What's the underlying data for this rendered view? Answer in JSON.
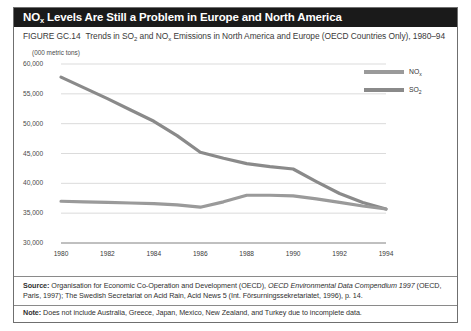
{
  "figure": {
    "title_main": "NO",
    "title_sub": "x",
    "title_rest": " Levels Are Still a Problem in Europe and North America",
    "figure_number": "FIGURE GC.14",
    "caption_part1": "Trends in SO",
    "caption_sub1": "2",
    "caption_part2": " and NO",
    "caption_sub2": "x",
    "caption_part3": " Emissions in North America and Europe (OECD Countries Only), 1980–94",
    "units_label": "(000 metric tons)"
  },
  "legend": {
    "position": "top-right",
    "entries": [
      {
        "label": "NO",
        "sub": "x",
        "color": "#9a9a9a"
      },
      {
        "label": "SO",
        "sub": "2",
        "color": "#8a8a8a"
      }
    ]
  },
  "footer": {
    "source_label": "Source:",
    "source_text_1": " Organisation for Economic Co-Operation and Development (OECD), ",
    "source_italic": "OECD Environmental Data Compendium 1997",
    "source_text_2": " (OECD,",
    "source_line2": "Paris, 1997); The Swedish Secretariat on Acid Rain, Acid News 5 (Int. Försurningssekretariatet, 1996), p. 14.",
    "note_label": "Note:",
    "note_text": " Does not include Australia, Greece, Japan, Mexico, New Zealand, and Turkey due to incomplete data."
  },
  "colors": {
    "title_background": "#1a1a1a",
    "title_text": "#ffffff",
    "frame_border": "#6f6f6f",
    "gridline": "#cccccc",
    "axis_line": "#808080",
    "so2_line": "#8a8a8a",
    "nox_line": "#9a9a9a",
    "text_primary": "#2f2f2f"
  },
  "chart_data": {
    "type": "line",
    "title": "Trends in SO2 and NOx Emissions in North America and Europe (OECD Countries Only), 1980–94",
    "xlabel": "",
    "ylabel": "(000 metric tons)",
    "ylim": [
      30000,
      60000
    ],
    "yticks": [
      30000,
      35000,
      40000,
      45000,
      50000,
      55000,
      60000
    ],
    "ytick_labels": [
      "30,000",
      "35,000",
      "40,000",
      "45,000",
      "50,000",
      "55,000",
      "60,000"
    ],
    "xlim": [
      1980,
      1994
    ],
    "xticks": [
      1980,
      1982,
      1984,
      1986,
      1988,
      1990,
      1992,
      1994
    ],
    "xtick_labels": [
      "1980",
      "1982",
      "1984",
      "1986",
      "1988",
      "1990",
      "1992",
      "1994"
    ],
    "grid": true,
    "x": [
      1980,
      1981,
      1982,
      1983,
      1984,
      1985,
      1986,
      1987,
      1988,
      1989,
      1990,
      1991,
      1992,
      1993,
      1994
    ],
    "series": [
      {
        "name": "SO2",
        "color": "#8a8a8a",
        "values": [
          57800,
          56000,
          54200,
          52300,
          50400,
          48000,
          45200,
          44200,
          43300,
          42800,
          42400,
          40300,
          38300,
          36800,
          35700
        ]
      },
      {
        "name": "NOx",
        "color": "#9a9a9a",
        "values": [
          37000,
          36900,
          36800,
          36700,
          36600,
          36400,
          36000,
          36900,
          38000,
          38000,
          37900,
          37400,
          36800,
          36200,
          35700
        ]
      }
    ]
  }
}
